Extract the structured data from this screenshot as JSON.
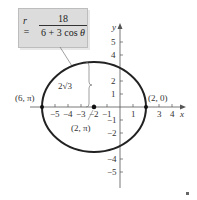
{
  "equation": {
    "lhs": "r =",
    "numerator": "18",
    "denominator_prefix": "6 + 3 cos ",
    "denominator_var": "θ"
  },
  "axes": {
    "x_label": "x",
    "y_label": "y",
    "x_ticks": [
      "−5",
      "−4",
      "−3",
      "−2",
      "−1",
      "1",
      "3",
      "4"
    ],
    "y_ticks": [
      "5",
      "4",
      "2",
      "1",
      "−1",
      "−2",
      "−4",
      "−5"
    ]
  },
  "annotations": {
    "left_vertex": "(6, π)",
    "right_vertex": "(2, 0)",
    "center": "(2, π)",
    "minor_axis": "2√3"
  },
  "colors": {
    "curve": "#222222",
    "axis": "#555555",
    "box": "#dcdcdc"
  }
}
